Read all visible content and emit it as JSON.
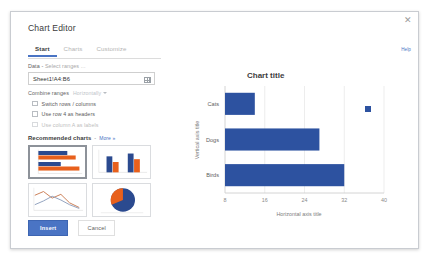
{
  "dialog": {
    "title": "Chart Editor",
    "close_icon": "close-icon",
    "help_label": "Help"
  },
  "tabs": [
    {
      "label": "Start",
      "active": true
    },
    {
      "label": "Charts",
      "active": false
    },
    {
      "label": "Customize",
      "active": false
    }
  ],
  "form": {
    "data_label": "Data",
    "data_label_sep": " - ",
    "data_label_hint": "Select ranges ...",
    "range_value": "Sheet1!A4:B6",
    "range_picker_icon": "grid-select-icon",
    "combine_label": "Combine ranges",
    "combine_value": "Horizontally",
    "combine_caret_icon": "chevron-down-icon",
    "checkboxes": [
      {
        "label": "Switch rows / columns",
        "checked": false,
        "disabled": false
      },
      {
        "label": "Use row 4 as headers",
        "checked": false,
        "disabled": false
      },
      {
        "label": "Use column A as labels",
        "checked": false,
        "disabled": true
      }
    ],
    "recommended_title": "Recommended charts",
    "recommended_dash": "-",
    "recommended_more": "More »"
  },
  "thumbnails": [
    {
      "name": "horizontal-bar-chart-thumb",
      "type": "bar-horizontal",
      "selected": true
    },
    {
      "name": "column-chart-thumb",
      "type": "bar-vertical",
      "selected": false
    },
    {
      "name": "line-chart-thumb",
      "type": "line",
      "selected": false
    },
    {
      "name": "pie-chart-thumb",
      "type": "pie",
      "selected": false
    }
  ],
  "footer": {
    "insert_label": "Insert",
    "cancel_label": "Cancel"
  },
  "colors": {
    "accent": "#4a74c4",
    "bar": "#2d52a0",
    "thumb_blue": "#2b4a8f",
    "thumb_orange": "#e8601c",
    "axis": "#cfcfcf",
    "text": "#3c3c3c",
    "muted": "#b4b4b4"
  },
  "chart_data": {
    "type": "bar",
    "orientation": "horizontal",
    "title": "Chart title",
    "xlabel": "Horizontal axis title",
    "ylabel": "Vertical axis title",
    "categories": [
      "Cats",
      "Dogs",
      "Birds"
    ],
    "values": [
      14,
      27,
      32
    ],
    "series": [
      {
        "name": "Series 1",
        "values": [
          14,
          27,
          32
        ],
        "color": "#2d52a0"
      }
    ],
    "xticks": [
      8,
      16,
      24,
      32,
      40
    ],
    "xlim": [
      8,
      40
    ],
    "grid": true,
    "grid_axis": "x",
    "legend": {
      "position": "right",
      "marker": "square",
      "color": "#2d52a0"
    }
  }
}
